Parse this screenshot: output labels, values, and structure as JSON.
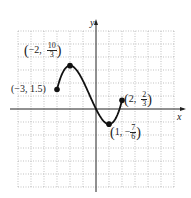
{
  "chart_data": {
    "type": "line",
    "title": "",
    "xlabel": "x",
    "ylabel": "y",
    "xlim": [
      -6,
      6
    ],
    "ylim": [
      -6,
      6
    ],
    "grid": true,
    "series": [
      {
        "name": "f(x)",
        "x": [
          -3,
          -2.5,
          -2,
          -1.5,
          -1,
          -0.5,
          0,
          0.5,
          1,
          1.5,
          2
        ],
        "y": [
          1.5,
          2.8,
          3.333,
          3.0,
          2.0,
          0.9,
          0.0,
          -0.8,
          -1.167,
          -0.6,
          0.667
        ]
      }
    ],
    "annotations": [
      {
        "x": -3,
        "y": 1.5,
        "text": "(-3, 1.5)"
      },
      {
        "x": -2,
        "y": 3.333,
        "text": "(-2, 10/3)"
      },
      {
        "x": 1,
        "y": -1.167,
        "text": "(1, -7/6)"
      },
      {
        "x": 2,
        "y": 0.667,
        "text": "(2, 2/3)"
      }
    ]
  },
  "labels": {
    "x_axis": "x",
    "y_axis": "y",
    "p1": "(−3, 1.5)",
    "p2_x": "−2,",
    "p2_num": "10",
    "p2_den": "3",
    "p3_x": "1, −",
    "p3_num": "7",
    "p3_den": "6",
    "p4_x": "2,",
    "p4_num": "2",
    "p4_den": "3"
  }
}
